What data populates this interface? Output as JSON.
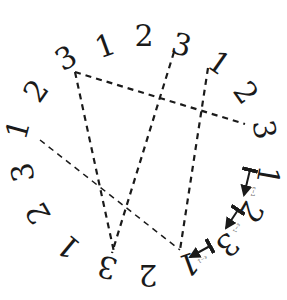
{
  "diagram": {
    "type": "circular-braid-chord-diagram",
    "labels": [
      {
        "text": "1",
        "x": 106,
        "y": 48,
        "rot": -20
      },
      {
        "text": "2",
        "x": 144,
        "y": 38,
        "rot": 0
      },
      {
        "text": "3",
        "x": 181,
        "y": 47,
        "rot": 15
      },
      {
        "text": "1",
        "x": 218,
        "y": 65,
        "rot": 35
      },
      {
        "text": "2",
        "x": 244,
        "y": 94,
        "rot": 55
      },
      {
        "text": "3",
        "x": 262,
        "y": 130,
        "rot": 80
      },
      {
        "text": "1",
        "x": 266,
        "y": 175,
        "rot": 100
      },
      {
        "text": "2",
        "x": 249,
        "y": 211,
        "rot": 120
      },
      {
        "text": "3",
        "x": 226,
        "y": 243,
        "rot": 140
      },
      {
        "text": "1",
        "x": 188,
        "y": 262,
        "rot": 160
      },
      {
        "text": "2",
        "x": 148,
        "y": 273,
        "rot": 180
      },
      {
        "text": "3",
        "x": 108,
        "y": 265,
        "rot": 195
      },
      {
        "text": "1",
        "x": 70,
        "y": 245,
        "rot": 220
      },
      {
        "text": "2",
        "x": 40,
        "y": 212,
        "rot": 240
      },
      {
        "text": "3",
        "x": 25,
        "y": 172,
        "rot": 260
      },
      {
        "text": "1",
        "x": 20,
        "y": 130,
        "rot": 285
      },
      {
        "text": "2",
        "x": 38,
        "y": 92,
        "rot": 305
      },
      {
        "text": "3",
        "x": 67,
        "y": 60,
        "rot": 330
      }
    ],
    "chords": [
      {
        "from": "3 (top-left)",
        "to": "3 (right)",
        "x1": 75,
        "y1": 72,
        "x2": 245,
        "y2": 124,
        "weight": 2.2
      },
      {
        "from": "3 (top-left)",
        "to": "3 (bottom)",
        "x1": 75,
        "y1": 72,
        "x2": 114,
        "y2": 252,
        "weight": 2.2
      },
      {
        "from": "3 (top)",
        "to": "3 (bottom)",
        "x1": 174,
        "y1": 52,
        "x2": 112,
        "y2": 253,
        "weight": 2.2
      },
      {
        "from": "1 (top-right)",
        "to": "1 (bottom)",
        "x1": 208,
        "y1": 68,
        "x2": 180,
        "y2": 250,
        "weight": 2.2
      },
      {
        "from": "1 (left)",
        "to": "1 (bottom)",
        "x1": 40,
        "y1": 140,
        "x2": 180,
        "y2": 250,
        "weight": 1.5
      }
    ],
    "arrows": [
      {
        "x1": 250,
        "y1": 170,
        "x2": 244,
        "y2": 195,
        "label": "ε−1"
      },
      {
        "x1": 238,
        "y1": 210,
        "x2": 226,
        "y2": 228,
        "label": "ε−1"
      },
      {
        "x1": 210,
        "y1": 246,
        "x2": 190,
        "y2": 257,
        "label": "ε−1"
      }
    ]
  }
}
